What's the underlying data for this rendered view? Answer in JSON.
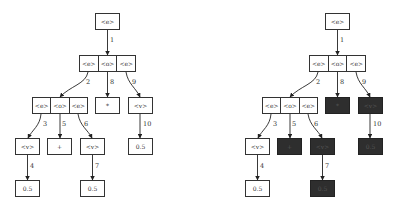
{
  "trees": [
    {
      "id": "left",
      "offset_x": 0,
      "nodes": [
        {
          "key": "root",
          "x": 95,
          "y": 13,
          "w": 25,
          "cells": [
            "<e>"
          ],
          "dark": false
        },
        {
          "key": "r2",
          "x": 79,
          "y": 55,
          "w": 57,
          "cells": [
            "<e>",
            "<o>",
            "<e>"
          ],
          "dark": false
        },
        {
          "key": "r3a",
          "x": 32,
          "y": 97,
          "w": 56,
          "cells": [
            "<e>",
            "<o>",
            "<e>"
          ],
          "dark": false
        },
        {
          "key": "mul",
          "x": 95,
          "y": 97,
          "w": 25,
          "cells": [
            "*"
          ],
          "dark": false
        },
        {
          "key": "r3c",
          "x": 128,
          "y": 97,
          "w": 25,
          "cells": [
            "<v>"
          ],
          "dark": false
        },
        {
          "key": "v1",
          "x": 15,
          "y": 138,
          "w": 25,
          "cells": [
            "<v>"
          ],
          "dark": false
        },
        {
          "key": "plus",
          "x": 47,
          "y": 138,
          "w": 25,
          "cells": [
            "+"
          ],
          "dark": false
        },
        {
          "key": "v2",
          "x": 80,
          "y": 138,
          "w": 25,
          "cells": [
            "<v>"
          ],
          "dark": false
        },
        {
          "key": "n05c",
          "x": 128,
          "y": 138,
          "w": 25,
          "cells": [
            "0.5"
          ],
          "dark": false
        },
        {
          "key": "n05a",
          "x": 15,
          "y": 180,
          "w": 25,
          "cells": [
            "0.5"
          ],
          "dark": false
        },
        {
          "key": "n05b",
          "x": 80,
          "y": 180,
          "w": 25,
          "cells": [
            "0.5"
          ],
          "dark": false
        }
      ]
    },
    {
      "id": "right",
      "offset_x": 230,
      "nodes": [
        {
          "key": "root",
          "x": 95,
          "y": 13,
          "w": 25,
          "cells": [
            "<e>"
          ],
          "dark": false
        },
        {
          "key": "r2",
          "x": 79,
          "y": 55,
          "w": 57,
          "cells": [
            "<e>",
            "<o>",
            "<e>"
          ],
          "dark": false
        },
        {
          "key": "r3a",
          "x": 32,
          "y": 97,
          "w": 56,
          "cells": [
            "<e>",
            "<o>",
            "<e>"
          ],
          "dark": false
        },
        {
          "key": "mul",
          "x": 95,
          "y": 97,
          "w": 25,
          "cells": [
            "*"
          ],
          "dark": true
        },
        {
          "key": "r3c",
          "x": 128,
          "y": 97,
          "w": 25,
          "cells": [
            "<v>"
          ],
          "dark": true
        },
        {
          "key": "v1",
          "x": 15,
          "y": 138,
          "w": 25,
          "cells": [
            "<v>"
          ],
          "dark": false
        },
        {
          "key": "plus",
          "x": 47,
          "y": 138,
          "w": 25,
          "cells": [
            "+"
          ],
          "dark": true
        },
        {
          "key": "v2",
          "x": 80,
          "y": 138,
          "w": 25,
          "cells": [
            "<v>"
          ],
          "dark": true
        },
        {
          "key": "n05c",
          "x": 128,
          "y": 138,
          "w": 25,
          "cells": [
            "0.5"
          ],
          "dark": true
        },
        {
          "key": "n05a",
          "x": 15,
          "y": 180,
          "w": 25,
          "cells": [
            "0.5"
          ],
          "dark": false
        },
        {
          "key": "n05b",
          "x": 80,
          "y": 180,
          "w": 25,
          "cells": [
            "0.5"
          ],
          "dark": true
        }
      ]
    }
  ],
  "edges": [
    {
      "label": "1",
      "path": "M107.5 30 L107.5 55",
      "lx": 110,
      "ly": 40
    },
    {
      "label": "2",
      "path": "M88 72 C86 84 70 86 60 97",
      "lx": 86,
      "ly": 82
    },
    {
      "label": "8",
      "path": "M107.5 72 L107.5 97",
      "lx": 110,
      "ly": 82
    },
    {
      "label": "9",
      "path": "M126 72 C128 84 136 88 140 97",
      "lx": 132,
      "ly": 82
    },
    {
      "label": "3",
      "path": "M41 114 C40 126 32 130 28 138",
      "lx": 43,
      "ly": 124
    },
    {
      "label": "5",
      "path": "M60 114 L60 138",
      "lx": 62,
      "ly": 124
    },
    {
      "label": "6",
      "path": "M78 114 C80 126 88 130 92 138",
      "lx": 84,
      "ly": 124
    },
    {
      "label": "10",
      "path": "M140 114 L140 138",
      "lx": 143,
      "ly": 124
    },
    {
      "label": "4",
      "path": "M27.5 155 L27.5 180",
      "lx": 30,
      "ly": 166
    },
    {
      "label": "7",
      "path": "M92.5 155 L92.5 180",
      "lx": 95,
      "ly": 166
    }
  ]
}
